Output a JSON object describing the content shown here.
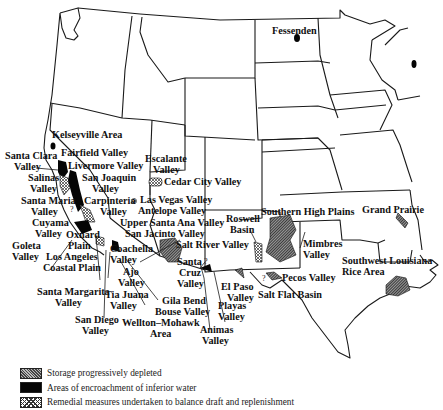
{
  "map": {
    "subject": "Groundwater overdraft areas, western and central United States",
    "colors": {
      "border": "#1a1a1a",
      "depleted_fill": "#555555",
      "encroachment_fill": "#050505",
      "remedial_fill": "#dddddd"
    },
    "labels": {
      "fessenden": "Fessenden",
      "kelseyville": "Kelseyville Area",
      "fairfield": "Fairfield Valley",
      "santa_clara_1": "Santa Clara",
      "santa_clara_2": "Valley",
      "livermore": "Livermore Valley",
      "salinas_1": "Salinas",
      "salinas_2": "Valley",
      "san_joaquin_1": "San Joaquin",
      "san_joaquin_2": "Valley",
      "santa_maria_1": "Santa Maria",
      "santa_maria_2": "Valley",
      "carpinteria_1": "Carpinteria",
      "carpinteria_2": "Valley",
      "escalante_1": "Escalante",
      "escalante_2": "Valley",
      "cedar_city": "Cedar City Valley",
      "las_vegas": "Las Vegas Valley",
      "antelope": "Antelope Valley",
      "cuyama_1": "Cuyama",
      "cuyama_2": "Valley",
      "oxnard_1": "Oxnard",
      "oxnard_2": "Plain",
      "upper_santa_ana": "Upper Santa Ana Valley",
      "goleta_1": "Goleta",
      "goleta_2": "Valley",
      "los_angeles_1": "Los Angeles",
      "los_angeles_2": "Coastal Plain",
      "san_jacinto": "San Jacinto Valley",
      "coachella_1": "Coachella",
      "coachella_2": "Valley",
      "ajo_1": "Ajo",
      "ajo_2": "Valley",
      "salt_river": "Salt River Valley",
      "santa_cruz_1": "Santa",
      "santa_cruz_2": "Cruz",
      "santa_cruz_3": "Valley",
      "roswell_1": "Roswell",
      "roswell_2": "Basin",
      "southern_high_plains": "Southern High Plains",
      "grand_prairie": "Grand Prairie",
      "mimbres_1": "Mimbres",
      "mimbres_2": "Valley",
      "santa_margarita_1": "Santa Margarita",
      "santa_margarita_2": "Valley",
      "tia_juana_1": "Tia Juana",
      "tia_juana_2": "Valley",
      "gila_bend": "Gila Bend",
      "bouse": "Bouse Valley",
      "el_paso_1": "El Paso",
      "el_paso_2": "Valley",
      "pecos": "Pecos Valley",
      "salt_flat": "Salt Flat Basin",
      "sw_louisiana_1": "Southwest Louisiana",
      "sw_louisiana_2": "Rice Area",
      "san_diego_1": "San Diego",
      "san_diego_2": "Valley",
      "playas_1": "Playas",
      "playas_2": "Valley",
      "wellton_1": "Wellton–Mohawk",
      "wellton_2": "Area",
      "animas_1": "Animas",
      "animas_2": "Valley",
      "question_mark": "?"
    }
  },
  "legend": {
    "items": [
      {
        "key": "depleted",
        "label": "Storage progressively depleted"
      },
      {
        "key": "encroachment",
        "label": "Areas of encroachment of inferior water"
      },
      {
        "key": "remedial",
        "label": "Remedial measures undertaken to balance draft and replenishment"
      }
    ]
  }
}
